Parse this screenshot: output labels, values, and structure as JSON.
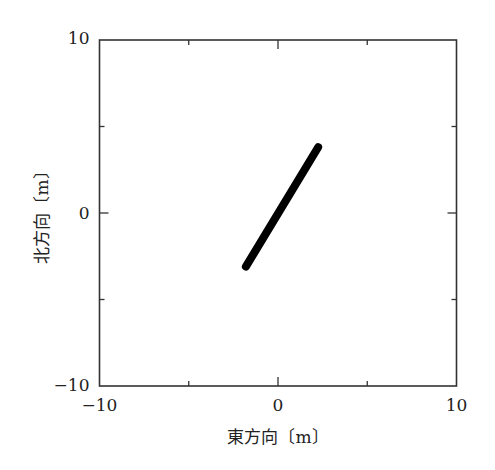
{
  "chart_data": {
    "type": "line",
    "title": "",
    "xlabel": "東方向〔m〕",
    "ylabel": "北方向〔m〕",
    "xlim": [
      -10,
      10
    ],
    "ylim": [
      -10,
      10
    ],
    "xticks": [
      -10,
      -5,
      0,
      5,
      10
    ],
    "yticks": [
      -10,
      -5,
      0,
      5,
      10
    ],
    "xtick_labels": [
      "−10",
      "",
      "0",
      "",
      "10"
    ],
    "ytick_labels": [
      "−10",
      "",
      "0",
      "",
      "10"
    ],
    "grid": false,
    "legend": null,
    "series": [
      {
        "name": "trajectory",
        "color": "#000000",
        "x": [
          -1.8,
          2.25
        ],
        "y": [
          -3.1,
          3.8
        ]
      }
    ]
  }
}
